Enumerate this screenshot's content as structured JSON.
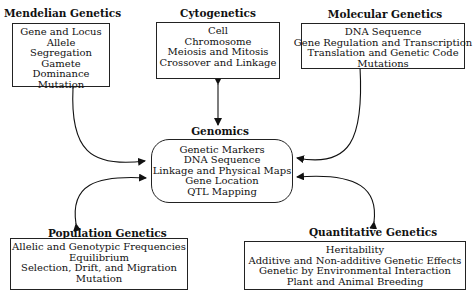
{
  "diagram": {
    "mendelian": {
      "title": "Mendelian Genetics",
      "items": [
        "Gene and Locus",
        "Allele",
        "Segregation",
        "Gamete",
        "Dominance",
        "Mutation"
      ]
    },
    "cytogenetics": {
      "title": "Cytogenetics",
      "items": [
        "Cell",
        "Chromosome",
        "Meiosis and Mitosis",
        "Crossover and Linkage"
      ]
    },
    "molecular": {
      "title": "Molecular Genetics",
      "items": [
        "DNA Sequence",
        "Gene Regulation and Transcription",
        "Translation and Genetic Code",
        "Mutations"
      ]
    },
    "genomics": {
      "title": "Genomics",
      "items": [
        "Genetic Markers",
        "DNA Sequence",
        "Linkage and Physical Maps",
        "Gene Location",
        "QTL Mapping"
      ]
    },
    "population": {
      "title": "Population Genetics",
      "items": [
        "Allelic and Genotypic Frequencies",
        "Equilibrium",
        "Selection, Drift, and Migration",
        "Mutation"
      ]
    },
    "quantitative": {
      "title": "Quantitative Genetics",
      "items": [
        "Heritability",
        "Additive and Non-additive Genetic Effects",
        "Genetic by Environmental Interaction",
        "Plant and Animal Breeding"
      ]
    },
    "connections": [
      {
        "from": "Genomics",
        "to": "Mendelian Genetics",
        "type": "bidirectional"
      },
      {
        "from": "Genomics",
        "to": "Cytogenetics",
        "type": "bidirectional"
      },
      {
        "from": "Genomics",
        "to": "Molecular Genetics",
        "type": "bidirectional"
      },
      {
        "from": "Genomics",
        "to": "Population Genetics",
        "type": "bidirectional"
      },
      {
        "from": "Genomics",
        "to": "Quantitative Genetics",
        "type": "bidirectional"
      }
    ]
  }
}
